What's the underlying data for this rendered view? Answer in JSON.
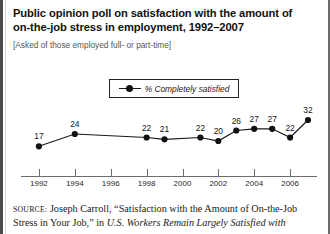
{
  "figure": {
    "title": "Public opinion poll on satisfaction with the amount of on-the-job stress in employment, 1992–2007",
    "title_line1": "Public opinion poll on satisfaction with the amount of",
    "title_line2": "on-the-job stress in employment, 1992–2007",
    "subtitle": "[Asked of those employed full- or part-time]"
  },
  "source": {
    "label": "SOURCE:",
    "line1_rest": " Joseph Carroll, “Satisfaction with the Amount of On-the-Job",
    "line2_roman_a": "Stress in Your Job,” in ",
    "line2_italic": "U.S. Workers Remain Largely Satisfied with",
    "line3_clipped": "Their Jobs, The Gallup Poll,"
  },
  "chart_data": {
    "type": "line",
    "title": "Public opinion poll on satisfaction with the amount of on-the-job stress in employment, 1992–2007",
    "xlabel": "",
    "ylabel": "",
    "grid": false,
    "legend_position": "top-center",
    "legend": [
      "% Completely satisfied"
    ],
    "series": [
      {
        "name": "% Completely satisfied",
        "x": [
          1992,
          1994,
          1998,
          1999,
          2001,
          2002,
          2003,
          2004,
          2005,
          2006,
          2007
        ],
        "values": [
          17,
          24,
          22,
          21,
          22,
          20,
          26,
          27,
          27,
          22,
          32
        ],
        "color": "#111111"
      }
    ],
    "xticks": [
      1992,
      1994,
      1996,
      1998,
      2000,
      2002,
      2004,
      2006
    ],
    "xlim": [
      1991,
      2007.5
    ],
    "ylim": [
      0,
      40
    ],
    "point_labels": [
      "17",
      "24",
      "22",
      "21",
      "22",
      "20",
      "26",
      "27",
      "27",
      "22",
      "32"
    ]
  }
}
